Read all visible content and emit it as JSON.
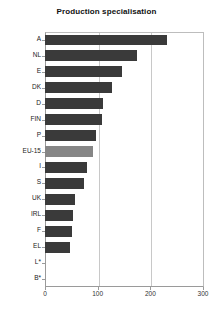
{
  "chart_data": {
    "type": "bar",
    "orientation": "horizontal",
    "title": "Production specialisation",
    "xlabel": "",
    "ylabel": "",
    "categories": [
      "A",
      "NL",
      "E",
      "DK",
      "D",
      "FIN",
      "P",
      "EU-15",
      "I",
      "S",
      "UK",
      "IRL",
      "F",
      "EL",
      "L*",
      "B*"
    ],
    "values": [
      232,
      175,
      147,
      128,
      111,
      109,
      96,
      91,
      79,
      74,
      57,
      53,
      52,
      47,
      0,
      0
    ],
    "highlight_category": "EU-15",
    "xlim": [
      0,
      300
    ],
    "xticks": [
      0,
      100,
      200,
      300
    ],
    "xtick_labels": [
      "0",
      "100",
      "200",
      "300"
    ],
    "grid": "vertical",
    "legend": "none",
    "colors": {
      "bar": "#3a3a3a",
      "highlight_bar": "#868686",
      "background": "#ffffff",
      "gridline": "#c8c8c8",
      "axis": "#9a9a9a",
      "text": "#222222"
    }
  }
}
